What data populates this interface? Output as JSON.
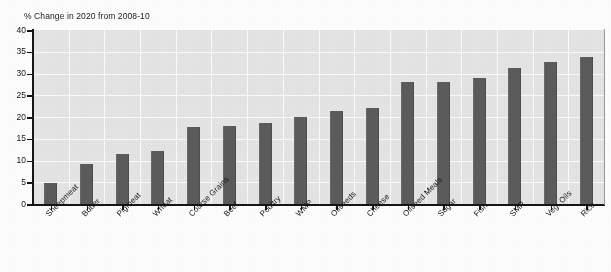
{
  "chart_data": {
    "type": "bar",
    "title": "% Change in 2020 from 2008-10",
    "xlabel": "",
    "ylabel": "",
    "ylim": [
      0,
      40
    ],
    "ytick_step": 5,
    "grid": true,
    "legend": "none",
    "orientation": "vertical",
    "bar_color": "#5c5c5c",
    "plot_background": "#e6e6e6",
    "gridline_color": "#fdfdfd",
    "categories": [
      "Sheepmeat",
      "Butter",
      "Pigmeat",
      "Wheat",
      "Coarse Grains",
      "Beef",
      "Poultry",
      "WMP",
      "Oilseeds",
      "Cheese",
      "Oilseed Meals",
      "Sugar",
      "Fish",
      "SMP",
      "Veg. Oils",
      "Rice"
    ],
    "values": [
      4.8,
      9.3,
      11.5,
      12.2,
      17.8,
      17.9,
      18.6,
      20.0,
      21.4,
      22.0,
      28.0,
      28.1,
      28.9,
      31.3,
      32.7,
      33.9
    ],
    "ytick_labels": [
      "0",
      "5",
      "10",
      "15",
      "20",
      "25",
      "30",
      "35",
      "40"
    ]
  }
}
